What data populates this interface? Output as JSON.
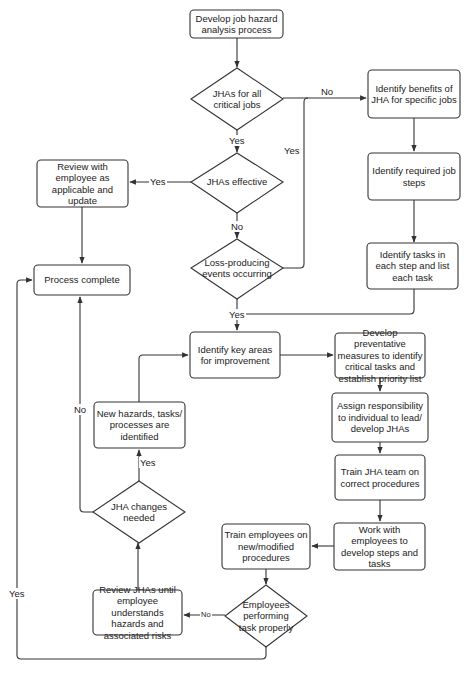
{
  "diagram": {
    "type": "flowchart",
    "nodes": {
      "start": "Develop job hazard analysis process",
      "d_all_critical": "JHAs for all critical jobs",
      "benefits": "Identify benefits of JHA for specific jobs",
      "job_steps": "Identify required job steps",
      "d_effective": "JHAs effective",
      "review_employee": "Review with employee as applicable and update",
      "process_complete": "Process complete",
      "d_loss": "Loss-producing events occurring",
      "tasks_each_step": "Identify tasks in each step and list each task",
      "key_areas": "Identify key areas for improvement",
      "preventative": "Develop preventative measures to identify critical tasks and establish priority list",
      "assign": "Assign responsibility to individual to lead/ develop JHAs",
      "new_hazards": "New hazards, tasks/ processes are identified",
      "train_team": "Train JHA team on correct procedures",
      "d_changes": "JHA changes needed",
      "train_employees": "Train employees on new/modified procedures",
      "work_with": "Work with employees to develop steps and tasks",
      "d_performing": "Employees performing task properly",
      "review_jhas": "Review JHAs until employee understands hazards and associated risks"
    },
    "edge_labels": {
      "all_critical_no": "No",
      "all_critical_yes": "Yes",
      "loss_no_to_top_yes": "Yes",
      "effective_yes": "Yes",
      "effective_no": "No",
      "loss_yes": "Yes",
      "changes_yes": "Yes",
      "changes_no": "No",
      "performing_no": "No",
      "performing_yes": "Yes"
    },
    "edges": [
      [
        "start",
        "d_all_critical",
        ""
      ],
      [
        "d_all_critical",
        "benefits",
        "No"
      ],
      [
        "d_all_critical",
        "d_effective",
        "Yes"
      ],
      [
        "d_loss",
        "benefits",
        "Yes"
      ],
      [
        "benefits",
        "job_steps",
        ""
      ],
      [
        "job_steps",
        "tasks_each_step",
        ""
      ],
      [
        "d_effective",
        "review_employee",
        "Yes"
      ],
      [
        "d_effective",
        "d_loss",
        "No"
      ],
      [
        "review_employee",
        "process_complete",
        ""
      ],
      [
        "d_loss",
        "key_areas",
        "Yes"
      ],
      [
        "tasks_each_step",
        "key_areas",
        ""
      ],
      [
        "key_areas",
        "preventative",
        ""
      ],
      [
        "preventative",
        "assign",
        ""
      ],
      [
        "assign",
        "train_team",
        ""
      ],
      [
        "train_team",
        "work_with",
        ""
      ],
      [
        "work_with",
        "train_employees",
        ""
      ],
      [
        "train_employees",
        "d_performing",
        ""
      ],
      [
        "d_performing",
        "review_jhas",
        "No"
      ],
      [
        "d_performing",
        "process_complete",
        "Yes"
      ],
      [
        "review_jhas",
        "d_changes",
        ""
      ],
      [
        "d_changes",
        "new_hazards",
        "Yes"
      ],
      [
        "d_changes",
        "process_complete",
        "No"
      ],
      [
        "new_hazards",
        "key_areas",
        ""
      ]
    ]
  }
}
